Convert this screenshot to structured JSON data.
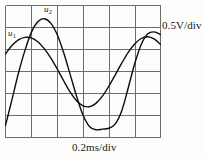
{
  "instrument": {
    "type": "oscilloscope-display",
    "vertical_scale_label": "0.5V/div",
    "horizontal_scale_label": "0.2ms/div"
  },
  "traces": {
    "u1": {
      "label": "u",
      "subscript": "1"
    },
    "u2": {
      "label": "u",
      "subscript": "2"
    }
  },
  "chart_data": {
    "type": "line",
    "title": "",
    "subtitle": "",
    "xlabel": "0.2ms/div",
    "ylabel": "0.5V/div",
    "grid": true,
    "grid_columns": 6,
    "grid_rows": 6,
    "legend_position": "in-plot-annotations",
    "annotations": [
      {
        "text": "u1",
        "x_div": 0.15,
        "y_div": 4.0
      },
      {
        "text": "u2",
        "x_div": 1.55,
        "y_div": 5.25
      },
      {
        "text": "0.5V/div",
        "position": "right-of-plot"
      },
      {
        "text": "0.2ms/div",
        "position": "below-plot"
      }
    ],
    "x_units": "ms",
    "y_units": "V",
    "x_per_div": 0.2,
    "y_per_div": 0.5,
    "xlim_div": [
      0,
      6
    ],
    "ylim_div": [
      0,
      6
    ],
    "series": [
      {
        "name": "u1",
        "waveform": "sine",
        "amplitude_div": 1.6,
        "amplitude_v": 0.8,
        "offset_div": 3.0,
        "period_div": 4.4,
        "period_ms": 0.88,
        "phase_deg": 28,
        "peak_x_div": 1.05,
        "peak_y_div": 4.55,
        "trough_x_div": 3.25,
        "trough_y_div": 1.4,
        "x": [
          0.0,
          0.25,
          0.5,
          0.75,
          1.0,
          1.25,
          1.5,
          1.75,
          2.0,
          2.25,
          2.5,
          2.75,
          3.0,
          3.25,
          3.5,
          3.75,
          4.0,
          4.25,
          4.5,
          4.75,
          5.0,
          5.25,
          5.5,
          5.75,
          6.0
        ],
        "y": [
          3.8,
          4.18,
          4.44,
          4.55,
          4.53,
          4.35,
          4.04,
          3.62,
          3.12,
          2.58,
          2.07,
          1.67,
          1.44,
          1.4,
          1.55,
          1.88,
          2.33,
          2.85,
          3.38,
          3.87,
          4.25,
          4.5,
          4.58,
          4.48,
          4.23
        ]
      },
      {
        "name": "u2",
        "waveform": "sine",
        "amplitude_div": 2.65,
        "amplitude_v": 1.325,
        "offset_div": 2.85,
        "period_div": 5.1,
        "period_ms": 1.02,
        "phase_deg": -22,
        "peak_x_div": 1.8,
        "peak_y_div": 5.4,
        "trough_x_div": 4.5,
        "trough_y_div": 0.4,
        "x": [
          0.0,
          0.25,
          0.5,
          0.75,
          1.0,
          1.25,
          1.5,
          1.75,
          2.0,
          2.25,
          2.5,
          2.75,
          3.0,
          3.25,
          3.5,
          3.75,
          4.0,
          4.25,
          4.5,
          4.75,
          5.0,
          5.25,
          5.5,
          5.75,
          6.0
        ],
        "y": [
          0.55,
          1.72,
          2.92,
          3.95,
          4.78,
          5.26,
          5.4,
          5.2,
          4.68,
          3.86,
          2.88,
          1.88,
          1.02,
          0.5,
          0.35,
          0.38,
          0.42,
          0.62,
          1.22,
          2.25,
          3.35,
          4.22,
          4.7,
          4.8,
          4.68
        ]
      }
    ]
  }
}
